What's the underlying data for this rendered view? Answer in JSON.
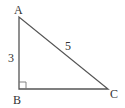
{
  "figure": {
    "type": "right-triangle",
    "vertices": {
      "A": {
        "label": "A",
        "x": 19,
        "y": 17
      },
      "B": {
        "label": "B",
        "x": 19,
        "y": 89
      },
      "C": {
        "label": "C",
        "x": 108,
        "y": 89
      }
    },
    "sides": {
      "AB": {
        "label": "3"
      },
      "AC": {
        "label": "5"
      },
      "BC": {
        "label": ""
      }
    },
    "right_angle_at": "B",
    "colors": {
      "stroke": "#555555",
      "text": "#333333",
      "background": "#ffffff"
    }
  }
}
